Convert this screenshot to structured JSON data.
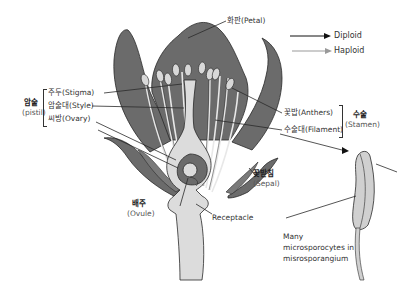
{
  "legend": {
    "diploid": {
      "label": "Diploid",
      "color": "#111111"
    },
    "haploid": {
      "label": "Haploid",
      "color": "#999999"
    }
  },
  "labels": {
    "petal": "화판(Petal)",
    "pistil_ko": "암술",
    "pistil_en": "(pistil)",
    "stigma": "주두(Stigma)",
    "style": "암술대(Style)",
    "ovary": "씨방(Ovary)",
    "anthers": "꽃밥(Anthers)",
    "filament": "수술대(Filament)",
    "stamen_ko": "수술",
    "stamen_en": "(Stamen)",
    "sepal_ko": "꽃받침",
    "sepal_en": "(Sepal)",
    "ovule_ko": "배주",
    "ovule_en": "(Ovule)",
    "receptacle": "Receptacle",
    "microsporocytes_1": "Many",
    "microsporocytes_2": "microsporocytes in",
    "microsporocytes_3": "misrosporangium"
  },
  "colors": {
    "petal": "#6b6b6b",
    "pistil": "#dcdcdc",
    "outline": "#2a2a2a"
  }
}
